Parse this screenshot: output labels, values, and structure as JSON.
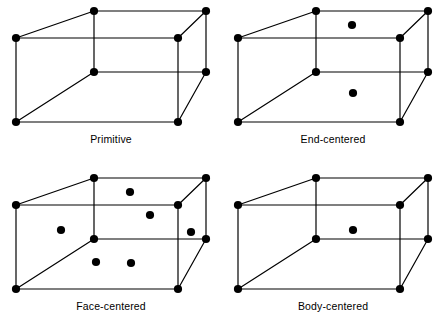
{
  "figure": {
    "background_color": "#ffffff",
    "line_color": "#000000",
    "node_color": "#000000",
    "node_radius": 4.1,
    "label_font_size": 10.5
  },
  "geometry": {
    "comment": "Oblique projection box shared by all four cells, in cell-local pixel coords",
    "front_bottom_left": [
      16,
      122
    ],
    "front_bottom_right": [
      178,
      122
    ],
    "front_top_left": [
      16,
      38
    ],
    "front_top_right": [
      178,
      38
    ],
    "back_bottom_left": [
      94,
      72
    ],
    "back_bottom_right": [
      206,
      72
    ],
    "back_top_left": [
      94,
      11
    ],
    "back_top_right": [
      206,
      11
    ],
    "edges": [
      [
        "front_bottom_left",
        "front_bottom_right"
      ],
      [
        "front_bottom_right",
        "front_top_right"
      ],
      [
        "front_top_right",
        "front_top_left"
      ],
      [
        "front_top_left",
        "front_bottom_left"
      ],
      [
        "back_bottom_left",
        "back_bottom_right"
      ],
      [
        "back_bottom_right",
        "back_top_right"
      ],
      [
        "back_top_right",
        "back_top_left"
      ],
      [
        "back_top_left",
        "back_bottom_left"
      ],
      [
        "front_bottom_left",
        "back_bottom_left"
      ],
      [
        "front_bottom_right",
        "back_bottom_right"
      ],
      [
        "front_top_left",
        "back_top_left"
      ],
      [
        "front_top_right",
        "back_top_right"
      ]
    ]
  },
  "cells": [
    {
      "id": "primitive",
      "label": "Primitive",
      "origin": [
        0,
        0
      ],
      "lattice_points_per_cell": 1,
      "corner_nodes": true,
      "extra_nodes": []
    },
    {
      "id": "end-centered",
      "label": "End-centered",
      "origin": [
        222,
        0
      ],
      "lattice_points_per_cell": 2,
      "corner_nodes": true,
      "extra_nodes": [
        {
          "name": "top-face-center",
          "x": 130,
          "y": 25
        },
        {
          "name": "bottom-face-center",
          "x": 131,
          "y": 93
        }
      ]
    },
    {
      "id": "face-centered",
      "label": "Face-centered",
      "origin": [
        0,
        167
      ],
      "lattice_points_per_cell": 4,
      "corner_nodes": true,
      "extra_nodes": [
        {
          "name": "top-face-center",
          "x": 130,
          "y": 25
        },
        {
          "name": "bottom-face-center",
          "x": 131,
          "y": 96
        },
        {
          "name": "back-face-center",
          "x": 150,
          "y": 48
        },
        {
          "name": "front-face-center",
          "x": 96,
          "y": 95
        },
        {
          "name": "left-face-center",
          "x": 61,
          "y": 63
        },
        {
          "name": "right-face-center",
          "x": 191,
          "y": 65
        }
      ]
    },
    {
      "id": "body-centered",
      "label": "Body-centered",
      "origin": [
        222,
        167
      ],
      "lattice_points_per_cell": 2,
      "corner_nodes": true,
      "extra_nodes": [
        {
          "name": "body-center",
          "x": 131,
          "y": 63
        }
      ]
    }
  ],
  "chart_data": {
    "type": "diagram",
    "categories": [
      "Primitive",
      "End-centered",
      "Face-centered",
      "Body-centered"
    ],
    "values": [
      1,
      2,
      4,
      2
    ],
    "value_meaning": "lattice points per unit cell",
    "annotations": [
      "Primitive: lattice points only at the 8 corners",
      "End-centered: corners plus centers of one pair of opposite faces (top and bottom)",
      "Face-centered: corners plus the centers of all six faces",
      "Body-centered: corners plus a single point at the center of the cell"
    ]
  }
}
